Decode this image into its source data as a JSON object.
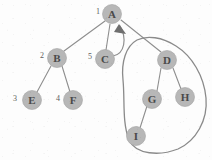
{
  "figure": {
    "canvas": {
      "width": 212,
      "height": 160
    },
    "colors": {
      "background": "#fdfdfd",
      "node_fill": "#b7b7b7",
      "node_stroke": "#a2a2a2",
      "node_text": "#4a4a4a",
      "edge": "#8e8e8e",
      "order_label_text": "#5c5c5c",
      "loop_stroke": "#8a8a8a",
      "arrow_head": "#6f6f6f"
    },
    "nodes": [
      {
        "id": "A",
        "label": "A",
        "order": "1",
        "cx": 112,
        "cy": 14,
        "r": 9.5,
        "order_x": 98,
        "order_y": 11
      },
      {
        "id": "B",
        "label": "B",
        "order": "2",
        "cx": 57,
        "cy": 58,
        "r": 9.5,
        "order_x": 42,
        "order_y": 55
      },
      {
        "id": "C",
        "label": "C",
        "order": "5",
        "cx": 105,
        "cy": 59,
        "r": 9.5,
        "order_x": 90,
        "order_y": 56
      },
      {
        "id": "D",
        "label": "D",
        "order": "",
        "cx": 167,
        "cy": 60,
        "r": 9.5,
        "order_x": 0,
        "order_y": 0
      },
      {
        "id": "E",
        "label": "E",
        "order": "3",
        "cx": 32,
        "cy": 100,
        "r": 9.5,
        "order_x": 15,
        "order_y": 98
      },
      {
        "id": "F",
        "label": "F",
        "order": "4",
        "cx": 73,
        "cy": 100,
        "r": 9.5,
        "order_x": 58,
        "order_y": 98
      },
      {
        "id": "G",
        "label": "G",
        "order": "",
        "cx": 152,
        "cy": 99,
        "r": 9.5,
        "order_x": 0,
        "order_y": 0
      },
      {
        "id": "H",
        "label": "H",
        "order": "",
        "cx": 185,
        "cy": 97,
        "r": 9.5,
        "order_x": 0,
        "order_y": 0
      },
      {
        "id": "I",
        "label": "I",
        "order": "",
        "cx": 136,
        "cy": 136,
        "r": 9.5,
        "order_x": 0,
        "order_y": 0
      }
    ],
    "edges": [
      {
        "from": "A",
        "to": "B",
        "type": "tree",
        "path": "M 105 21 L 64 51"
      },
      {
        "from": "A",
        "to": "C",
        "type": "tree",
        "path": "M 110 24 L 106 50"
      },
      {
        "from": "A",
        "to": "D",
        "type": "tree",
        "path": "M 121 20 L 161 52"
      },
      {
        "from": "B",
        "to": "E",
        "type": "tree",
        "path": "M 51 66 L 37 92"
      },
      {
        "from": "B",
        "to": "F",
        "type": "tree",
        "path": "M 62 66 L 70 92"
      },
      {
        "from": "D",
        "to": "G",
        "type": "tree",
        "path": "M 161 68 L 157 91"
      },
      {
        "from": "D",
        "to": "H",
        "type": "tree",
        "path": "M 173 68 L 181 89"
      },
      {
        "from": "G",
        "to": "I",
        "type": "tree",
        "path": "M 147 106 L 140 128"
      }
    ],
    "back_edge": {
      "from": "C",
      "to": "A",
      "type": "back-edge-arrow",
      "path": "M 113 56 C 125 54, 127 38, 120 26",
      "arrow_tip": "120,25",
      "arrow_polygon": "119,24 126,34 114,32"
    },
    "grouping_loop": {
      "label": "hand-drawn enclosure around D, G, H, I",
      "encloses": [
        "D",
        "G",
        "H",
        "I"
      ],
      "path": "M 137 40 C 126 46, 121 62, 123 80 C 125 100, 122 122, 129 140 C 136 155, 160 156, 178 149 C 196 141, 208 120, 206 98 C 204 76, 192 56, 176 46 C 162 37, 147 35, 137 40 Z"
    }
  }
}
